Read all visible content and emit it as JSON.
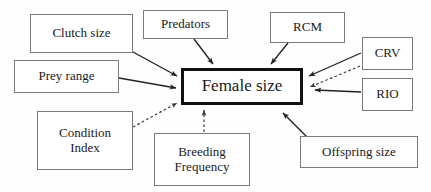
{
  "diagram": {
    "background_color": "#fefefe",
    "center": {
      "id": "female-size",
      "label": "Female size"
    },
    "nodes": [
      {
        "id": "clutch-size",
        "label": "Clutch size"
      },
      {
        "id": "prey-range",
        "label": "Prey range"
      },
      {
        "id": "predators",
        "label": "Predators"
      },
      {
        "id": "rcm",
        "label": "RCM"
      },
      {
        "id": "crv",
        "label": "CRV"
      },
      {
        "id": "rio",
        "label": "RIO"
      },
      {
        "id": "condition-index",
        "label": "Condition\nIndex"
      },
      {
        "id": "breeding-frequency",
        "label": "Breeding\nFrequency"
      },
      {
        "id": "offspring-size",
        "label": "Offspring size"
      }
    ],
    "edges": [
      {
        "from": "clutch-size",
        "to": "female-size",
        "style": "solid"
      },
      {
        "from": "prey-range",
        "to": "female-size",
        "style": "solid"
      },
      {
        "from": "predators",
        "to": "female-size",
        "style": "solid"
      },
      {
        "from": "rcm",
        "to": "female-size",
        "style": "solid"
      },
      {
        "from": "crv",
        "to": "female-size",
        "style": "solid"
      },
      {
        "from": "crv",
        "to": "female-size",
        "style": "dashed"
      },
      {
        "from": "rio",
        "to": "female-size",
        "style": "solid"
      },
      {
        "from": "condition-index",
        "to": "female-size",
        "style": "dashed"
      },
      {
        "from": "breeding-frequency",
        "to": "female-size",
        "style": "dashed"
      },
      {
        "from": "offspring-size",
        "to": "female-size",
        "style": "solid"
      }
    ],
    "edge_colors": {
      "solid": "#222222",
      "dashed": "#3a3a3a"
    }
  }
}
